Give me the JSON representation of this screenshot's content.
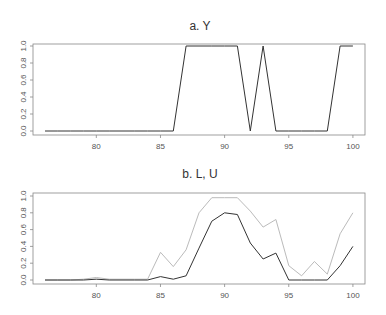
{
  "chart_data": [
    {
      "type": "line",
      "title": "a.  Y",
      "xlabel": "",
      "ylabel": "",
      "x": [
        76,
        77,
        78,
        79,
        80,
        81,
        82,
        83,
        84,
        85,
        86,
        87,
        88,
        89,
        90,
        91,
        92,
        93,
        94,
        95,
        96,
        97,
        98,
        99,
        100
      ],
      "series": [
        {
          "name": "Y",
          "color": "#333333",
          "values": [
            0,
            0,
            0,
            0,
            0,
            0,
            0,
            0,
            0,
            0,
            0,
            1,
            1,
            1,
            1,
            1,
            0,
            1,
            0,
            0,
            0,
            0,
            0,
            1,
            1
          ]
        }
      ],
      "xticks": [
        80,
        85,
        90,
        95,
        100
      ],
      "yticks": [
        "0.0",
        "0.2",
        "0.4",
        "0.6",
        "0.8",
        "1.0"
      ],
      "xlim": [
        74.5,
        101
      ],
      "ylim": [
        0,
        1
      ],
      "grid": false
    },
    {
      "type": "line",
      "title": "b.  L, U",
      "xlabel": "",
      "ylabel": "",
      "x": [
        76,
        77,
        78,
        79,
        80,
        81,
        82,
        83,
        84,
        85,
        86,
        87,
        88,
        89,
        90,
        91,
        92,
        93,
        94,
        95,
        96,
        97,
        98,
        99,
        100
      ],
      "series": [
        {
          "name": "L",
          "color": "#333333",
          "values": [
            0,
            0,
            0,
            0,
            0.01,
            0,
            0,
            0,
            0,
            0.04,
            0.01,
            0.05,
            0.38,
            0.7,
            0.8,
            0.78,
            0.44,
            0.25,
            0.32,
            0,
            0,
            0,
            0,
            0.17,
            0.4
          ]
        },
        {
          "name": "U",
          "color": "#bbbbbb",
          "values": [
            0,
            0,
            0,
            0.01,
            0.03,
            0.01,
            0.01,
            0.01,
            0.01,
            0.33,
            0.16,
            0.36,
            0.8,
            0.98,
            0.98,
            0.98,
            0.82,
            0.63,
            0.72,
            0.17,
            0.05,
            0.22,
            0.07,
            0.55,
            0.8
          ]
        }
      ],
      "xticks": [
        80,
        85,
        90,
        95,
        100
      ],
      "yticks": [
        "0.0",
        "0.2",
        "0.4",
        "0.6",
        "0.8",
        "1.0"
      ],
      "xlim": [
        74.5,
        101
      ],
      "ylim": [
        0,
        1
      ],
      "grid": false
    }
  ]
}
